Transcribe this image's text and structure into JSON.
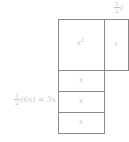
{
  "diagram": {
    "background_color": "#ffffff",
    "line_color": "#8a8a8a",
    "label_color": "#c2c2c2",
    "cells": {
      "big_square": "x",
      "big_square_exponent": "2",
      "right_column": "x",
      "row_1": "x",
      "row_2": "x",
      "row_3": "x"
    },
    "labels": {
      "left_expression": {
        "numerator": "1",
        "denominator": "2",
        "rest": "(6x) = 3x"
      },
      "top_right_expression": {
        "numerator": "1",
        "denominator": "2",
        "rest": "("
      }
    }
  }
}
